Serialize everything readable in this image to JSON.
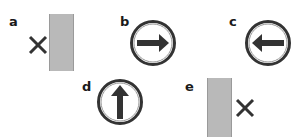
{
  "panels": [
    {
      "label": "a",
      "icon": "x-mark",
      "object": "gray-bar",
      "arrangement": "cross-left-of-bar"
    },
    {
      "label": "b",
      "icon": "arrow-right-circle"
    },
    {
      "label": "c",
      "icon": "arrow-left-circle"
    },
    {
      "label": "d",
      "icon": "arrow-up-circle"
    },
    {
      "label": "e",
      "icon": "x-mark",
      "object": "gray-bar",
      "arrangement": "cross-right-of-bar"
    }
  ],
  "colors": {
    "bar": "#b9b9b9",
    "icon": "#333333",
    "background": "#ffffff"
  }
}
